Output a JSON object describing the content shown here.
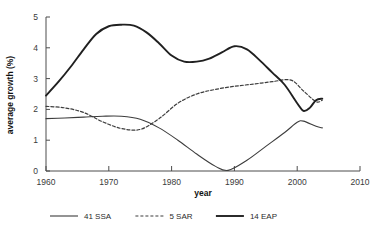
{
  "chart_data": {
    "type": "line",
    "title": "",
    "xlabel": "year",
    "ylabel": "average growth (%)",
    "xlim": [
      1960,
      2010
    ],
    "ylim": [
      0,
      5
    ],
    "xticks": [
      1960,
      1970,
      1980,
      1990,
      2000,
      2010
    ],
    "yticks": [
      0,
      1,
      2,
      3,
      4,
      5
    ],
    "grid": false,
    "legend_position": "bottom",
    "series": [
      {
        "name": "41 SSA",
        "style": "solid-thin",
        "color": "#3d3d3d",
        "width": 1.1,
        "dash": "",
        "x": [
          1960,
          1963,
          1966,
          1969,
          1972,
          1975,
          1978,
          1981,
          1984,
          1987,
          1989,
          1992,
          1995,
          1998,
          2000,
          2001,
          2003,
          2004
        ],
        "y": [
          1.7,
          1.72,
          1.75,
          1.78,
          1.78,
          1.68,
          1.4,
          1.0,
          0.55,
          0.15,
          0.02,
          0.35,
          0.8,
          1.25,
          1.58,
          1.62,
          1.45,
          1.4
        ]
      },
      {
        "name": "5 SAR",
        "style": "dashed",
        "color": "#3d3d3d",
        "width": 1.2,
        "dash": "3,2",
        "x": [
          1960,
          1963,
          1966,
          1969,
          1972,
          1975,
          1978,
          1981,
          1984,
          1987,
          1990,
          1993,
          1996,
          1999,
          2001,
          2003,
          2004
        ],
        "y": [
          2.1,
          2.05,
          1.9,
          1.6,
          1.38,
          1.35,
          1.7,
          2.2,
          2.5,
          2.65,
          2.75,
          2.82,
          2.9,
          2.95,
          2.6,
          2.25,
          2.3
        ]
      },
      {
        "name": "14 EAP",
        "style": "solid-thick",
        "color": "#202020",
        "width": 1.9,
        "dash": "",
        "x": [
          1960,
          1962,
          1964,
          1966,
          1968,
          1970,
          1972,
          1974,
          1976,
          1978,
          1980,
          1982,
          1984,
          1986,
          1988,
          1990,
          1992,
          1994,
          1996,
          1998,
          2000,
          2001,
          2002,
          2003,
          2004
        ],
        "y": [
          2.45,
          2.9,
          3.4,
          3.95,
          4.45,
          4.7,
          4.75,
          4.72,
          4.5,
          4.15,
          3.75,
          3.55,
          3.55,
          3.65,
          3.85,
          4.05,
          3.95,
          3.6,
          3.2,
          2.8,
          2.2,
          1.95,
          2.05,
          2.3,
          2.35
        ]
      }
    ]
  },
  "legend": {
    "items": [
      {
        "label": "41 SSA"
      },
      {
        "label": "5 SAR"
      },
      {
        "label": "14 EAP"
      }
    ]
  },
  "axes": {
    "x_title": "year",
    "y_title": "average growth (%)",
    "x_tick_labels": [
      "1960",
      "1970",
      "1980",
      "1990",
      "2000",
      "2010"
    ],
    "y_tick_labels": [
      "0",
      "1",
      "2",
      "3",
      "4",
      "5"
    ]
  }
}
